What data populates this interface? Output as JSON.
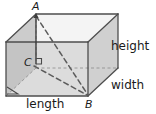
{
  "figure": {
    "type": "rectangular-prism-diagram",
    "vertices": [
      {
        "id": "A",
        "label": "A",
        "x": 36,
        "y": 14,
        "role": "top-front-left"
      },
      {
        "id": "B",
        "label": "B",
        "x": 88,
        "y": 96,
        "role": "bottom-back-right"
      },
      {
        "id": "C",
        "label": "C",
        "x": 33,
        "y": 63,
        "role": "interior-front-left"
      }
    ],
    "dimension_labels": [
      {
        "id": "height",
        "label": "height",
        "x": 111,
        "y": 40
      },
      {
        "id": "width",
        "label": "width",
        "x": 111,
        "y": 79
      },
      {
        "id": "length",
        "label": "length",
        "x": 26,
        "y": 98
      }
    ],
    "colors": {
      "outline": "#4a4a4a",
      "dashed": "#5a5a5a",
      "face_left": "#c3c3c3",
      "face_front": "#dedede",
      "face_right": "#d2d2d2",
      "face_top": "#f3f3f3",
      "face_top_left": "#cfcfcf",
      "text": "#1a1a1a",
      "background": "#ffffff"
    },
    "geometry": {
      "front_top_left": [
        6,
        42
      ],
      "front_top_right": [
        88,
        42
      ],
      "front_bottom_left": [
        6,
        96
      ],
      "front_bottom_right": [
        88,
        96
      ],
      "back_top_left": [
        36,
        14
      ],
      "back_top_right": [
        118,
        14
      ],
      "back_bottom_left": [
        36,
        68
      ],
      "back_bottom_right": [
        118,
        68
      ]
    },
    "dashed_segments": [
      {
        "from": "A",
        "to": "B",
        "name": "space-diagonal-A-B"
      },
      {
        "from": "C",
        "to": "B",
        "name": "base-diagonal-C-B"
      }
    ],
    "right_angle_markers": [
      {
        "id": "at-C",
        "x": 36,
        "y": 63
      },
      {
        "id": "at-front-bottom-left",
        "x": 12,
        "y": 88
      }
    ]
  }
}
